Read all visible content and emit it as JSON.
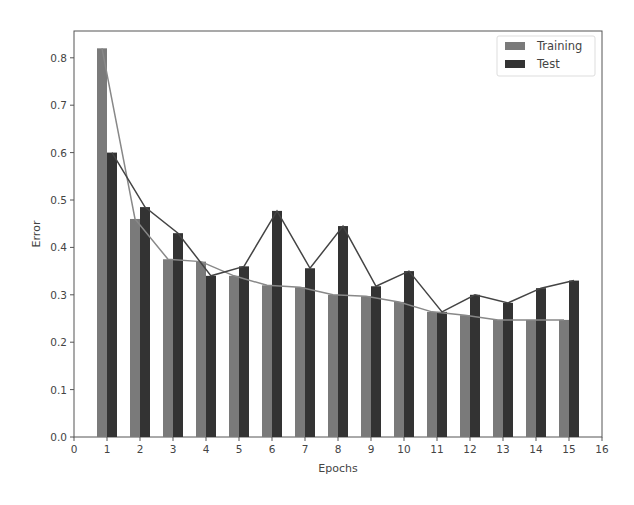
{
  "chart_data": {
    "type": "bar",
    "title": "",
    "xlabel": "Epochs",
    "ylabel": "Error",
    "xlim": [
      0,
      16
    ],
    "ylim": [
      0.0,
      0.85
    ],
    "xticks": [
      "0",
      "1",
      "2",
      "3",
      "4",
      "5",
      "6",
      "7",
      "8",
      "9",
      "10",
      "11",
      "12",
      "13",
      "14",
      "15",
      "16"
    ],
    "yticks": [
      "0.0",
      "0.1",
      "0.2",
      "0.3",
      "0.4",
      "0.5",
      "0.6",
      "0.7",
      "0.8"
    ],
    "categories": [
      1,
      2,
      3,
      4,
      5,
      6,
      7,
      8,
      9,
      10,
      11,
      12,
      13,
      14,
      15
    ],
    "series": [
      {
        "name": "Training",
        "color": "#7a7a7a",
        "values": [
          0.82,
          0.46,
          0.375,
          0.37,
          0.34,
          0.32,
          0.316,
          0.3,
          0.297,
          0.285,
          0.264,
          0.257,
          0.247,
          0.247,
          0.247
        ]
      },
      {
        "name": "Test",
        "color": "#333333",
        "values": [
          0.6,
          0.485,
          0.43,
          0.34,
          0.36,
          0.477,
          0.356,
          0.445,
          0.318,
          0.35,
          0.264,
          0.3,
          0.283,
          0.314,
          0.33
        ]
      }
    ],
    "overlay_lines": "Each series also drawn as a line connecting bar tops",
    "legend_position": "upper right",
    "grid": false
  },
  "legend": {
    "items": [
      {
        "label": "Training"
      },
      {
        "label": "Test"
      }
    ]
  },
  "axes": {
    "xlabel": "Epochs",
    "ylabel": "Error"
  }
}
